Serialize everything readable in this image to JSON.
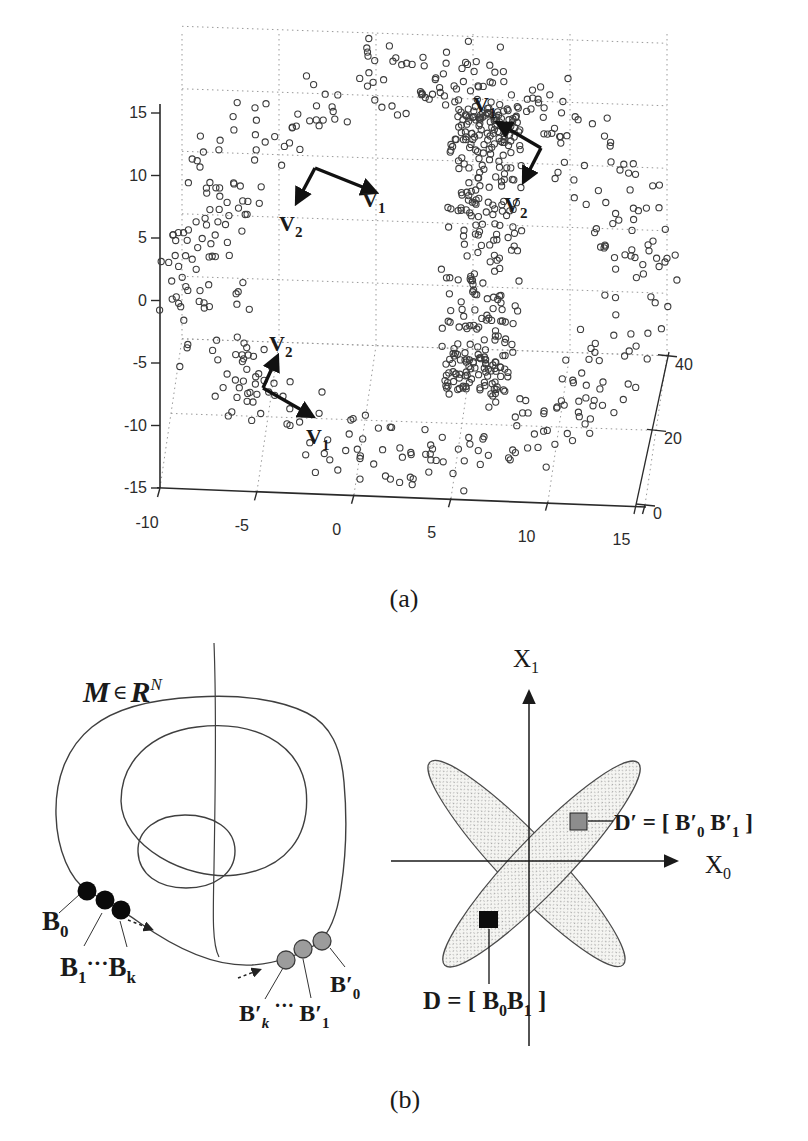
{
  "colors": {
    "background": "#ffffff",
    "ink": "#1a1a1a",
    "marker": "#3d3d3d",
    "grid": "#999999",
    "sketch": "#3f3f3f",
    "black_point": "#0a0a0a",
    "gray_point": "#9c9c9c",
    "gray_square": "#8d8d8d",
    "black_square": "#0c0c0c"
  },
  "captions": {
    "a": "(a)",
    "b": "(b)"
  },
  "plot3d": {
    "x_ticks": [
      -10,
      -5,
      0,
      5,
      10,
      15
    ],
    "y_ticks": [
      15,
      10,
      5,
      0,
      -5,
      -10,
      -15
    ],
    "z_ticks": [
      0,
      20,
      40
    ],
    "axis_ranges": {
      "x": [
        -10,
        15
      ],
      "y": [
        -15,
        15
      ],
      "z": [
        0,
        40
      ]
    },
    "proj": {
      "x0": 160,
      "y0": 488,
      "sx": 19.4,
      "sy": 12.5,
      "zx": 0.55,
      "zy": 3.73,
      "tilt": 0.68
    },
    "marker": {
      "radius": 3.1,
      "stroke_width": 1.1
    },
    "seed": 42,
    "rings": [
      {
        "kind": "xy",
        "n": 430,
        "cx": 2.8,
        "cy": -2,
        "rx": 11.2,
        "ry": 10.4,
        "tube": 2.2,
        "z0": 18,
        "zamp": 16,
        "zn": 5
      },
      {
        "kind": "yz",
        "n": 350,
        "cx": 6,
        "cy": -1,
        "ry": 9.5,
        "rz": 18.5,
        "z0": 20,
        "tx": 1.6,
        "ny": 0.8,
        "nz": 1.5
      }
    ],
    "vectors": [
      {
        "ox": 315,
        "oy": 168,
        "tx": 375,
        "ty": 192,
        "label": "V",
        "sub": "1",
        "lx": 362,
        "ly": 207
      },
      {
        "ox": 315,
        "oy": 168,
        "tx": 297,
        "ty": 202,
        "label": "V",
        "sub": "2",
        "lx": 279,
        "ly": 231
      },
      {
        "ox": 541,
        "oy": 148,
        "tx": 498,
        "ty": 123,
        "label": "V",
        "sub": "1",
        "lx": 473,
        "ly": 112
      },
      {
        "ox": 541,
        "oy": 148,
        "tx": 524,
        "ty": 181,
        "label": "V",
        "sub": "2",
        "lx": 504,
        "ly": 212
      },
      {
        "ox": 263,
        "oy": 388,
        "tx": 277,
        "ty": 357,
        "label": "V",
        "sub": "2",
        "lx": 269,
        "ly": 351
      },
      {
        "ox": 263,
        "oy": 388,
        "tx": 312,
        "ty": 416,
        "label": "V",
        "sub": "1",
        "lx": 306,
        "ly": 444
      }
    ]
  },
  "manifold": {
    "set_label": {
      "m": "M",
      "elem": "∈",
      "space": "R",
      "sup": "N"
    },
    "black_points": [
      [
        87,
        891
      ],
      [
        105,
        900
      ],
      [
        121,
        910
      ]
    ],
    "gray_points": [
      [
        286,
        960
      ],
      [
        303,
        949
      ],
      [
        322,
        941
      ]
    ],
    "labels": {
      "b0": {
        "m": "B",
        "s": "0"
      },
      "b1k": {
        "m1": "B",
        "s1": "1",
        "dots": "···",
        "m2": "B",
        "s2": "k"
      },
      "bpk": {
        "m1": "B′",
        "s1": "k",
        "dots": "···",
        "m2": "B′",
        "s2": "1"
      },
      "bp0": {
        "m": "B′",
        "s": "0"
      }
    }
  },
  "diagram2d": {
    "x1_label": {
      "m": "X",
      "s": "1"
    },
    "x0_label": {
      "m": "X",
      "s": "0"
    },
    "dp_label": {
      "pre": "D′ = [ ",
      "b1": "B′",
      "s1": "0",
      "b2": " B′",
      "s2": "1",
      "post": " ]"
    },
    "d_label": {
      "pre": "D = [ ",
      "b1": "B",
      "s1": "0",
      "b2": "B",
      "s2": "1",
      "post": " ]"
    }
  }
}
